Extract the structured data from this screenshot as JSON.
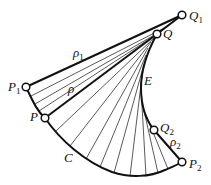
{
  "diagram": {
    "curve_C": {
      "label": "C",
      "label_pos": [
        64,
        162
      ],
      "path": "M26,87 C34,104 38,112 45,118 C60,140 85,162 112,172 C130,178 150,177 165,170 C172,167 177,165 182,162"
    },
    "evolute_E": {
      "label": "E",
      "label_pos": [
        144,
        85
      ],
      "path": "M182,15 L157,34 C147,52 141,70 141,88 C141,106 146,120 154,130 L182,162"
    },
    "thick_lines": [
      {
        "name": "rho1-segment",
        "from": [
          26,
          87
        ],
        "to": [
          182,
          15
        ]
      },
      {
        "name": "rho-segment",
        "from": [
          45,
          118
        ],
        "to": [
          157,
          34
        ]
      }
    ],
    "thin_lines": [
      {
        "from": [
          31,
          96
        ],
        "to": [
          168,
          26
        ]
      },
      {
        "from": [
          35,
          104
        ],
        "to": [
          163,
          30
        ]
      },
      {
        "from": [
          39,
          111
        ],
        "to": [
          160,
          32
        ]
      },
      {
        "from": [
          56,
          131
        ],
        "to": [
          154,
          38
        ]
      },
      {
        "from": [
          70,
          146
        ],
        "to": [
          151,
          42
        ]
      },
      {
        "from": [
          86,
          159
        ],
        "to": [
          148,
          48
        ]
      },
      {
        "from": [
          100,
          167
        ],
        "to": [
          146,
          55
        ]
      },
      {
        "from": [
          114,
          173
        ],
        "to": [
          144,
          64
        ]
      },
      {
        "from": [
          130,
          176
        ],
        "to": [
          142,
          76
        ]
      },
      {
        "from": [
          146,
          176
        ],
        "to": [
          141,
          88
        ]
      },
      {
        "from": [
          158,
          173
        ],
        "to": [
          142,
          102
        ]
      },
      {
        "from": [
          168,
          169
        ],
        "to": [
          146,
          115
        ]
      }
    ],
    "points": [
      {
        "id": "Q1",
        "label": "Q",
        "sub": "1",
        "x": 182,
        "y": 15,
        "label_pos": [
          189,
          20
        ]
      },
      {
        "id": "Q",
        "label": "Q",
        "sub": "",
        "x": 157,
        "y": 34,
        "label_pos": [
          163,
          38
        ]
      },
      {
        "id": "P1",
        "label": "P",
        "sub": "1",
        "x": 26,
        "y": 87,
        "label_pos": [
          8,
          91
        ]
      },
      {
        "id": "P",
        "label": "P",
        "sub": "",
        "x": 45,
        "y": 118,
        "label_pos": [
          30,
          121
        ]
      },
      {
        "id": "Q2",
        "label": "Q",
        "sub": "2",
        "x": 154,
        "y": 130,
        "label_pos": [
          160,
          132
        ]
      },
      {
        "id": "P2",
        "label": "P",
        "sub": "2",
        "x": 182,
        "y": 162,
        "label_pos": [
          189,
          168
        ]
      }
    ],
    "labels": [
      {
        "id": "rho1",
        "text": "ρ",
        "sub": "1",
        "x": 73,
        "y": 57
      },
      {
        "id": "rho",
        "text": "ρ",
        "sub": "",
        "x": 68,
        "y": 93
      },
      {
        "id": "rho2",
        "text": "ρ",
        "sub": "2",
        "x": 170,
        "y": 146
      }
    ],
    "colors": {
      "stroke": "#111111",
      "background": "#ffffff",
      "point_fill": "#ffffff"
    }
  }
}
